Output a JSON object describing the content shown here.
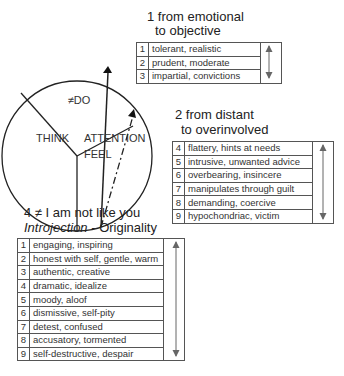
{
  "diagram": {
    "circle_labels": {
      "top": "≠DO",
      "left": "THINK",
      "right_1": "ATTENTION",
      "right_2": "FEEL"
    }
  },
  "sections": [
    {
      "heading_line1": "1 from emotional",
      "heading_line2": "to objective",
      "rows": [
        {
          "num": "1",
          "text": "tolerant, realistic"
        },
        {
          "num": "2",
          "text": "prudent, moderate"
        },
        {
          "num": "3",
          "text": "impartial, convictions"
        }
      ]
    },
    {
      "heading_line1": "2 from distant",
      "heading_line2": "to overinvolved",
      "rows": [
        {
          "num": "4",
          "text": "flattery, hints at needs"
        },
        {
          "num": "5",
          "text": "intrusive, unwanted advice"
        },
        {
          "num": "6",
          "text": "overbearing, insincere"
        },
        {
          "num": "7",
          "text": "manipulates through guilt"
        },
        {
          "num": "8",
          "text": "demanding, coercive"
        },
        {
          "num": "9",
          "text": "hypochondriac, victim"
        }
      ]
    },
    {
      "heading_line1": "4 ≠ I am not like you",
      "heading_line2_italic": "Introjection",
      "heading_line2_rest": " - Originality",
      "rows": [
        {
          "num": "1",
          "text": "engaging, inspiring"
        },
        {
          "num": "2",
          "text": "honest with self, gentle, warm"
        },
        {
          "num": "3",
          "text": "authentic, creative"
        },
        {
          "num": "4",
          "text": "dramatic, idealize"
        },
        {
          "num": "5",
          "text": "moody, aloof"
        },
        {
          "num": "6",
          "text": "dismissive, self-pity"
        },
        {
          "num": "7",
          "text": "detest, confused"
        },
        {
          "num": "8",
          "text": "accusatory, tormented"
        },
        {
          "num": "9",
          "text": "self-destructive, despair"
        }
      ]
    }
  ]
}
